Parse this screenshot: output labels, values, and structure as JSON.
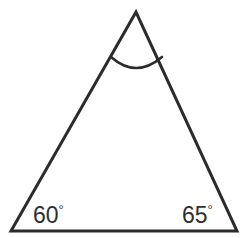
{
  "figure": {
    "type": "geometry-diagram",
    "shape": "triangle",
    "background_color": "#ffffff",
    "stroke_color": "#2b2b2b",
    "stroke_width": 3,
    "label_color": "#2f2f2f"
  },
  "triangle": {
    "vertices": {
      "apex": {
        "x": 136,
        "y": 12
      },
      "bottom_left": {
        "x": 11,
        "y": 231
      },
      "bottom_right": {
        "x": 237,
        "y": 231
      }
    },
    "path": "M136,12 L11,231 L237,231 Z"
  },
  "apex_arc": {
    "name": "angle-arc",
    "path": "M111,57 Q136,79 162,57",
    "start": {
      "x": 111,
      "y": 57
    },
    "end": {
      "x": 162,
      "y": 57
    },
    "control": {
      "x": 136,
      "y": 79
    }
  },
  "labels": {
    "left_angle": {
      "value": "60",
      "degree_symbol": "°",
      "text": "60°"
    },
    "right_angle": {
      "value": "65",
      "degree_symbol": "°",
      "text": "65°"
    }
  },
  "chart_data": {
    "type": "diagram",
    "title": "",
    "annotations": [
      "60°",
      "65°"
    ],
    "angles_labeled": [
      60,
      65
    ],
    "angle_unlabeled_marked_with_arc": "apex"
  }
}
